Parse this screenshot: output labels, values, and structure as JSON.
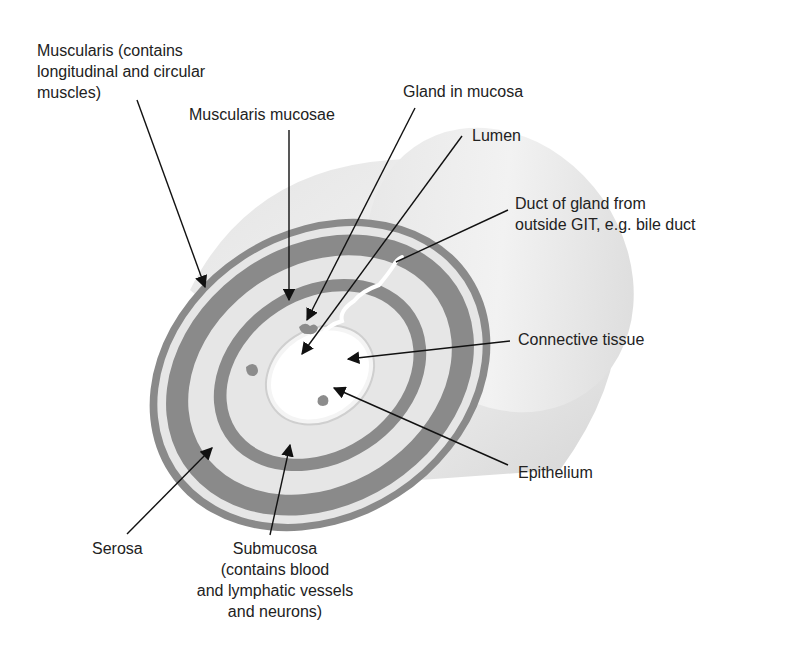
{
  "diagram": {
    "colors": {
      "dark_band": "#8a8a8a",
      "light_band": "#e6e6e6",
      "cylinder_body": "#dcdcdc",
      "lumen": "#ffffff",
      "gland": "#8c8c8c",
      "leader_line": "#111111"
    },
    "labels": {
      "muscularis": "Muscularis (contains\nlongitudinal and circular\nmuscles)",
      "muscularis_mucosae": "Muscularis mucosae",
      "gland_in_mucosa": "Gland in mucosa",
      "lumen": "Lumen",
      "duct": "Duct of gland from\noutside GIT, e.g. bile duct",
      "connective_tissue": "Connective tissue",
      "epithelium": "Epithelium",
      "serosa": "Serosa",
      "submucosa": "Submucosa\n(contains blood\nand lymphatic vessels\nand neurons)"
    }
  }
}
